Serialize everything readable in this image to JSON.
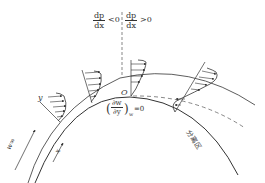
{
  "figure": {
    "type": "boundary-layer-separation-over-curved-surface",
    "pressure_gradient": {
      "left": {
        "num": "dp",
        "den": "dx",
        "relation": "<0"
      },
      "right": {
        "num": "dp",
        "den": "dx",
        "relation": ">0"
      }
    },
    "separation_point_label": "O",
    "wall_condition": {
      "num": "∂w",
      "den": "∂y",
      "subscript": "w",
      "relation": "=0"
    },
    "labels": {
      "y_axis": "y",
      "x_axis": "x",
      "freestream": "w∞",
      "separation_zone": "分离区"
    },
    "colors": {
      "line": "#333333",
      "background": "#ffffff"
    }
  }
}
